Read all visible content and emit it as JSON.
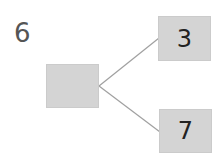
{
  "problem": {
    "number": "6"
  },
  "tree": {
    "root": {
      "value": ""
    },
    "children": [
      {
        "value": "3"
      },
      {
        "value": "7"
      }
    ]
  },
  "colors": {
    "box_fill": "#d4d4d4",
    "line": "#a0a0a0",
    "text": "#222222"
  }
}
